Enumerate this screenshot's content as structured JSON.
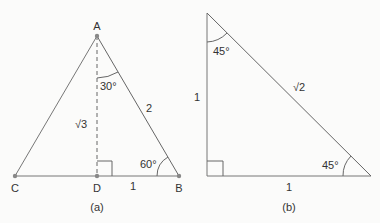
{
  "figure_a": {
    "caption": "(a)",
    "vertices": {
      "A": "A",
      "B": "B",
      "C": "C",
      "D": "D"
    },
    "angle_top": "30°",
    "angle_bottom_right": "60°",
    "side_hypotenuse": "2",
    "side_height": "√3",
    "side_base_half": "1"
  },
  "figure_b": {
    "caption": "(b)",
    "angle_top": "45°",
    "angle_bottom_right": "45°",
    "side_hypotenuse": "√2",
    "side_vertical": "1",
    "side_base": "1"
  },
  "colors": {
    "background": "#fbfbfa",
    "line": "#666666",
    "point": "#888888",
    "text": "#333333"
  }
}
